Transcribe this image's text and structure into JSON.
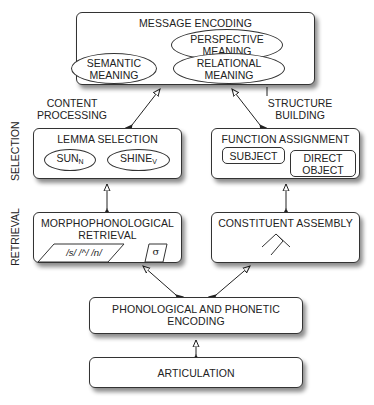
{
  "message_encoding": {
    "title": "MESSAGE ENCODING",
    "perspective": [
      "PERSPECTIVE",
      "MEANING"
    ],
    "semantic": [
      "SEMANTIC",
      "MEANING"
    ],
    "relational": [
      "RELATIONAL",
      "MEANING"
    ]
  },
  "side_labels": {
    "content": [
      "CONTENT",
      "PROCESSING"
    ],
    "structure": [
      "STRUCTURE",
      "BUILDING"
    ],
    "selection": "SELECTION",
    "retrieval": "RETRIEVAL"
  },
  "lemma_selection": {
    "title": "LEMMA SELECTION",
    "sun": "SUN",
    "sun_sub": "N",
    "shine": "SHINE",
    "shine_sub": "V"
  },
  "function_assignment": {
    "title": "FUNCTION ASSIGNMENT",
    "subject": "SUBJECT",
    "direct_object": [
      "DIRECT",
      "OBJECT"
    ]
  },
  "morphophonological": {
    "title": [
      "MORPHOPHONOLOGICAL",
      "RETRIEVAL"
    ],
    "phonemes": "/s/ /^/ /n/",
    "syllable": "σ"
  },
  "constituent_assembly": {
    "title": "CONSTITUENT ASSEMBLY"
  },
  "phonological_encoding": {
    "title": [
      "PHONOLOGICAL AND PHONETIC",
      "ENCODING"
    ]
  },
  "articulation": {
    "title": "ARTICULATION"
  }
}
